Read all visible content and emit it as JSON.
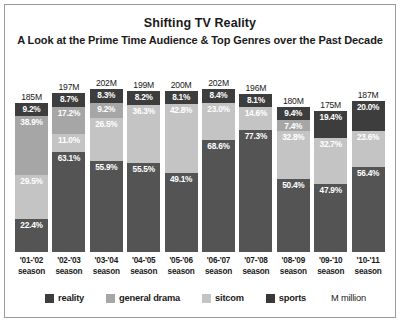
{
  "header": {
    "title": "Shifting TV Reality",
    "subtitle": "A Look at the Prime Time Audience & Top Genres over the Past Decade"
  },
  "legend": {
    "items": [
      {
        "key": "reality",
        "label": "reality",
        "color": "#3d3d3d"
      },
      {
        "key": "drama",
        "label": "general drama",
        "color": "#a6a6a6"
      },
      {
        "key": "sitcom",
        "label": "sitcom",
        "color": "#c4c4c4"
      },
      {
        "key": "sports",
        "label": "sports",
        "color": "#383838"
      }
    ],
    "note": "M million"
  },
  "chart_data": {
    "type": "bar",
    "stacked": true,
    "title": "Shifting TV Reality",
    "subtitle": "A Look at the Prime Time Audience & Top Genres over the Past Decade",
    "xlabel": "",
    "ylabel": "",
    "grid": false,
    "legend_position": "bottom",
    "categories": [
      "'01-'02 season",
      "'02-'03 season",
      "'03-'04 season",
      "'04-'05 season",
      "'05-'06 season",
      "'06-'07 season",
      "'07-'08 season",
      "'08-'09 season",
      "'09-'10 season",
      "'10-'11 season"
    ],
    "totals_label": [
      "185M",
      "197M",
      "202M",
      "199M",
      "200M",
      "202M",
      "196M",
      "180M",
      "175M",
      "187M"
    ],
    "totals": [
      185,
      197,
      202,
      199,
      200,
      202,
      196,
      180,
      175,
      187
    ],
    "series": [
      {
        "name": "reality",
        "values": [
          9.2,
          8.7,
          8.3,
          8.2,
          8.1,
          8.4,
          8.1,
          9.4,
          19.4,
          20.0
        ]
      },
      {
        "name": "general drama",
        "values": [
          38.9,
          17.2,
          9.2,
          null,
          null,
          null,
          null,
          7.4,
          null,
          null
        ]
      },
      {
        "name": "sitcom",
        "values": [
          29.5,
          11.0,
          26.5,
          36.3,
          42.8,
          23.0,
          14.6,
          32.8,
          32.7,
          23.6
        ]
      },
      {
        "name": "sports",
        "values": [
          22.4,
          63.1,
          55.9,
          55.5,
          49.1,
          68.6,
          77.3,
          50.4,
          47.9,
          56.4
        ]
      }
    ]
  },
  "bars": [
    {
      "total": "185M",
      "height_pct": 91.6,
      "season_line1": "'01-'02",
      "season_line2": "season",
      "segments": [
        {
          "key": "reality",
          "label": "9.2%",
          "value": 9.2
        },
        {
          "key": "drama",
          "label": "38.9%",
          "value": 38.9
        },
        {
          "key": "sitcom",
          "label": "29.5%",
          "value": 29.5
        },
        {
          "key": "sports",
          "label": "22.4%",
          "value": 22.4
        }
      ]
    },
    {
      "total": "197M",
      "height_pct": 97.5,
      "season_line1": "'02-'03",
      "season_line2": "season",
      "segments": [
        {
          "key": "reality",
          "label": "8.7%",
          "value": 8.7
        },
        {
          "key": "drama",
          "label": "17.2%",
          "value": 17.2
        },
        {
          "key": "sitcom",
          "label": "11.0%",
          "value": 11.0
        },
        {
          "key": "sports",
          "label": "63.1%",
          "value": 63.1
        }
      ]
    },
    {
      "total": "202M",
      "height_pct": 100.0,
      "season_line1": "'03-'04",
      "season_line2": "season",
      "segments": [
        {
          "key": "reality",
          "label": "8.3%",
          "value": 8.3
        },
        {
          "key": "drama",
          "label": "9.2%",
          "value": 9.2
        },
        {
          "key": "sitcom",
          "label": "26.5%",
          "value": 26.5
        },
        {
          "key": "sports",
          "label": "55.9%",
          "value": 55.9
        }
      ]
    },
    {
      "total": "199M",
      "height_pct": 98.5,
      "season_line1": "'04-'05",
      "season_line2": "season",
      "segments": [
        {
          "key": "reality",
          "label": "8.2%",
          "value": 8.2
        },
        {
          "key": "sitcom",
          "label": "36.3%",
          "value": 36.3
        },
        {
          "key": "sports",
          "label": "55.5%",
          "value": 55.5
        }
      ]
    },
    {
      "total": "200M",
      "height_pct": 99.0,
      "season_line1": "'05-'06",
      "season_line2": "season",
      "segments": [
        {
          "key": "reality",
          "label": "8.1%",
          "value": 8.1
        },
        {
          "key": "sitcom",
          "label": "42.8%",
          "value": 42.8
        },
        {
          "key": "sports",
          "label": "49.1%",
          "value": 49.1
        }
      ]
    },
    {
      "total": "202M",
      "height_pct": 100.0,
      "season_line1": "'06-'07",
      "season_line2": "season",
      "segments": [
        {
          "key": "reality",
          "label": "8.4%",
          "value": 8.4
        },
        {
          "key": "sitcom",
          "label": "23.0%",
          "value": 23.0
        },
        {
          "key": "sports",
          "label": "68.6%",
          "value": 68.6
        }
      ]
    },
    {
      "total": "196M",
      "height_pct": 97.0,
      "season_line1": "'07-'08",
      "season_line2": "season",
      "segments": [
        {
          "key": "reality",
          "label": "8.1%",
          "value": 8.1
        },
        {
          "key": "sitcom",
          "label": "14.6%",
          "value": 14.6
        },
        {
          "key": "sports",
          "label": "77.3%",
          "value": 77.3
        }
      ]
    },
    {
      "total": "180M",
      "height_pct": 89.1,
      "season_line1": "'08-'09",
      "season_line2": "season",
      "segments": [
        {
          "key": "reality",
          "label": "9.4%",
          "value": 9.4
        },
        {
          "key": "drama",
          "label": "7.4%",
          "value": 7.4
        },
        {
          "key": "sitcom",
          "label": "32.8%",
          "value": 32.8
        },
        {
          "key": "sports",
          "label": "50.4%",
          "value": 50.4
        }
      ]
    },
    {
      "total": "175M",
      "height_pct": 86.6,
      "season_line1": "'09-'10",
      "season_line2": "season",
      "segments": [
        {
          "key": "reality",
          "label": "19.4%",
          "value": 19.4
        },
        {
          "key": "sitcom",
          "label": "32.7%",
          "value": 32.7
        },
        {
          "key": "sports",
          "label": "47.9%",
          "value": 47.9
        }
      ]
    },
    {
      "total": "187M",
      "height_pct": 92.6,
      "season_line1": "'10-'11",
      "season_line2": "season",
      "segments": [
        {
          "key": "reality",
          "label": "20.0%",
          "value": 20.0
        },
        {
          "key": "sitcom",
          "label": "23.6%",
          "value": 23.6
        },
        {
          "key": "sports",
          "label": "56.4%",
          "value": 56.4
        }
      ]
    }
  ]
}
